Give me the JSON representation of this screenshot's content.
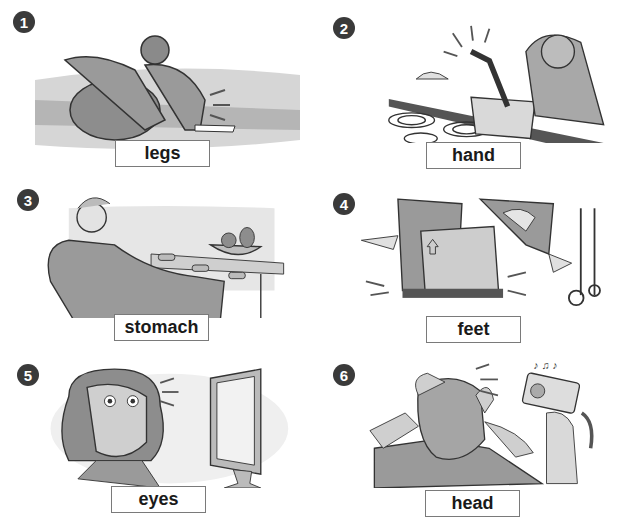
{
  "panels": [
    {
      "number": "1",
      "label": "legs",
      "scene": "athlete sitting on running track holding sore legs"
    },
    {
      "number": "2",
      "label": "hand",
      "scene": "woman burning her hand on a hot pot on an electric stove"
    },
    {
      "number": "3",
      "label": "stomach",
      "scene": "man on a chair holding his stomach next to a table with apple cores and fruit bowl"
    },
    {
      "number": "4",
      "label": "feet",
      "scene": "man dropping a heavy box on his feet beside a hand truck"
    },
    {
      "number": "5",
      "label": "eyes",
      "scene": "woman with tired eyes looking at a computer monitor"
    },
    {
      "number": "6",
      "label": "head",
      "scene": "man holding his head while a girl plays a loud boombox"
    }
  ],
  "colors": {
    "badge": "#3a3a3a",
    "scene_gray": "#9a9a9a",
    "scene_light": "#d6d6d6",
    "label_border": "#7a7a7a"
  }
}
